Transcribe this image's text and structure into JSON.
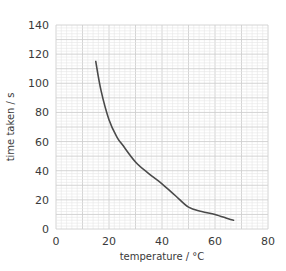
{
  "chart_data": {
    "type": "line",
    "title": "",
    "xlabel": "temperature / °C",
    "ylabel": "time taken / s",
    "xlim": [
      0,
      80
    ],
    "ylim": [
      0,
      140
    ],
    "xticks": [
      0,
      20,
      40,
      60,
      80
    ],
    "yticks": [
      0,
      20,
      40,
      60,
      80,
      100,
      120,
      140
    ],
    "grid": true,
    "grid_style": "graph paper (major every 10, minor every 2)",
    "legend": null,
    "series": [
      {
        "name": "time taken",
        "color": "#4a4a4a",
        "x": [
          15,
          17,
          20,
          23,
          25,
          30,
          35,
          40,
          45,
          50,
          55,
          60,
          65,
          67
        ],
        "y": [
          115,
          95,
          75,
          63,
          58,
          46,
          38,
          31,
          23,
          15,
          12,
          10,
          7,
          6
        ]
      }
    ]
  },
  "colors": {
    "minor_grid": "#e6e6e6",
    "major_grid": "#cfcfcf",
    "curve": "#4a4a4a",
    "text": "#3a3a3a"
  }
}
